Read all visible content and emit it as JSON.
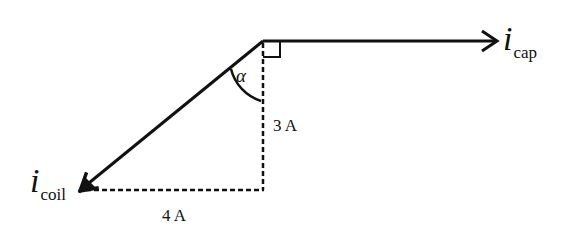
{
  "diagram": {
    "type": "phasor",
    "vectors": [
      {
        "id": "cap",
        "symbol": "i",
        "subscript": "cap",
        "direction": "right",
        "color": "#111111"
      },
      {
        "id": "coil",
        "symbol": "i",
        "subscript": "coil",
        "direction": "down-left",
        "color": "#111111"
      }
    ],
    "labels": {
      "vertical_leg": "3 A",
      "horizontal_leg": "4 A",
      "angle": "α"
    },
    "right_angle_marker": true,
    "dashed_legs": true
  }
}
